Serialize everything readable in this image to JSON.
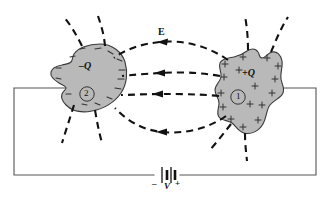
{
  "figure": {
    "background_color": "#ffffff",
    "conductor_fill": "#b9b9b9",
    "conductor_stroke": "#333333",
    "wire_color": "#555555",
    "field_line_color": "#111111",
    "canvas": {
      "width": 332,
      "height": 199
    }
  },
  "conductors": [
    {
      "id": "left-conductor",
      "charge_label": "–Q",
      "plate_number": "2",
      "polarity": "negative",
      "surface_charge_glyph": "–",
      "surface_charge_count": 14
    },
    {
      "id": "right-conductor",
      "charge_label": "+Q",
      "plate_number": "1",
      "polarity": "positive",
      "surface_charge_glyph": "+",
      "surface_charge_count": 16
    }
  ],
  "field": {
    "label": "E",
    "direction": "from +Q (right) to –Q (left)",
    "line_count": 4,
    "style": "dashed"
  },
  "battery": {
    "voltage_label": "V",
    "negative_terminal": "–",
    "positive_terminal": "+"
  }
}
